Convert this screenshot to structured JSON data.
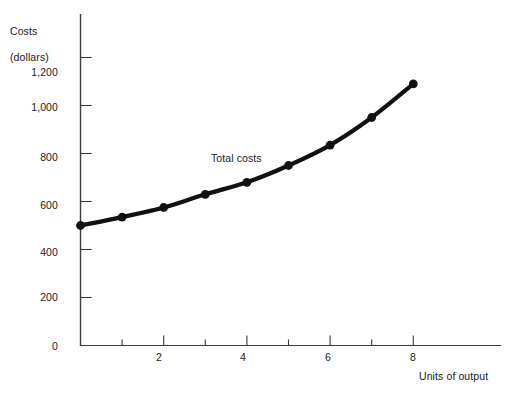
{
  "chart_data": {
    "type": "line",
    "title": "",
    "subtitle": "",
    "xlabel": "Units of output",
    "ylabel": "Costs\n(dollars)",
    "ylabel_line1": "Costs",
    "ylabel_line2": "(dollars)",
    "x": [
      0,
      1,
      2,
      3,
      4,
      5,
      6,
      7,
      8
    ],
    "series": [
      {
        "name": "Total costs",
        "values": [
          500,
          535,
          575,
          630,
          680,
          750,
          835,
          950,
          1090
        ]
      }
    ],
    "annotations": [
      {
        "text": "Total costs",
        "x": 3.1,
        "y": 800
      }
    ],
    "xlim": [
      0,
      10
    ],
    "ylim": [
      0,
      1300
    ],
    "x_ticks": [
      1,
      2,
      3,
      4,
      5,
      6,
      7,
      8
    ],
    "x_tick_labels": [
      "",
      "2",
      "",
      "4",
      "",
      "6",
      "",
      "8"
    ],
    "y_ticks": [
      0,
      200,
      400,
      600,
      800,
      1000,
      1200
    ],
    "y_tick_labels": [
      "0",
      "200",
      "400",
      "600",
      "800",
      "1,000",
      "1,200"
    ],
    "grid": false,
    "legend": "none",
    "marker": "filled-circle",
    "line_color": "#111111",
    "axis_color": "#3a3a3a",
    "background_color": "#ffffff"
  },
  "labels": {
    "y_title_line1": "Costs",
    "y_title_line2": "(dollars)",
    "x_title": "Units of output",
    "curve_label": "Total costs",
    "y_1200": "1,200",
    "y_1000": "1,000",
    "y_800": "800",
    "y_600": "600",
    "y_400": "400",
    "y_200": "200",
    "y_0": "0",
    "x_2": "2",
    "x_4": "4",
    "x_6": "6",
    "x_8": "8"
  }
}
